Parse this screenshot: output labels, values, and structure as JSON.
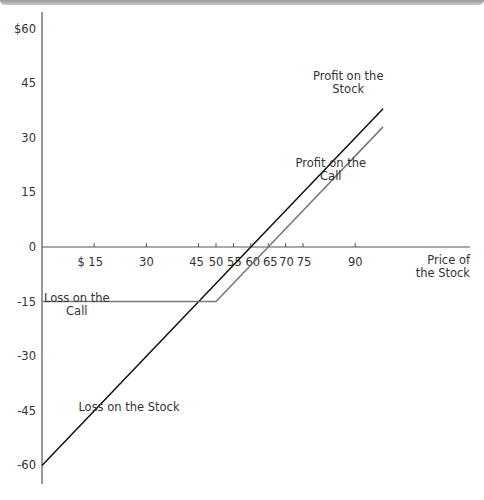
{
  "chart_data": {
    "type": "line",
    "title": "",
    "xlabel": "Price of the Stock",
    "ylabel": "",
    "xlim": [
      0,
      100
    ],
    "ylim": [
      -60,
      60
    ],
    "grid": false,
    "x_ticks": [
      "$ 15",
      "30",
      "45",
      "50",
      "55",
      "60",
      "65",
      "70",
      "75",
      "90"
    ],
    "x_tick_values": [
      15,
      30,
      45,
      50,
      55,
      60,
      65,
      70,
      75,
      90
    ],
    "y_ticks": [
      "$60",
      "45",
      "30",
      "15",
      "0",
      "-15",
      "-30",
      "-45",
      "-60"
    ],
    "y_tick_values": [
      60,
      45,
      30,
      15,
      0,
      -15,
      -30,
      -45,
      -60
    ],
    "series": [
      {
        "name": "Stock",
        "color": "#111111",
        "x": [
          0,
          60,
          98
        ],
        "y": [
          -60,
          0,
          38
        ]
      },
      {
        "name": "Call",
        "color": "#777777",
        "x": [
          0,
          50,
          65,
          98
        ],
        "y": [
          -15,
          -15,
          0,
          33
        ]
      }
    ],
    "annotations": [
      {
        "text_lines": [
          "Profit on the",
          "Stock"
        ],
        "x": 88,
        "y": 46
      },
      {
        "text_lines": [
          "Profit on the",
          "Call"
        ],
        "x": 83,
        "y": 22
      },
      {
        "text_lines": [
          "Loss on the",
          "Call"
        ],
        "x": 10,
        "y": -15
      },
      {
        "text_lines": [
          "Loss on the Stock"
        ],
        "x": 25,
        "y": -45
      }
    ],
    "x_axis_label_lines": [
      "Price of",
      "the Stock"
    ]
  }
}
